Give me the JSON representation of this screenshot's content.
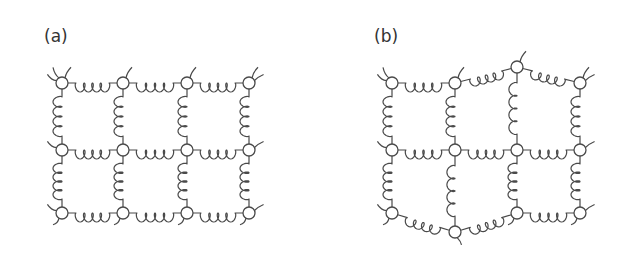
{
  "panels": [
    {
      "id": "a",
      "label": "(a)",
      "label_pos": [
        44,
        28
      ],
      "description": "regular lattice",
      "nodes": [
        [
          62,
          83
        ],
        [
          123,
          83
        ],
        [
          187,
          83
        ],
        [
          249,
          83
        ],
        [
          62,
          150
        ],
        [
          123,
          150
        ],
        [
          187,
          150
        ],
        [
          249,
          150
        ],
        [
          62,
          213
        ],
        [
          123,
          213
        ],
        [
          187,
          213
        ],
        [
          249,
          213
        ]
      ],
      "springs": [
        [
          0,
          1,
          "tight"
        ],
        [
          1,
          2,
          "tight"
        ],
        [
          2,
          3,
          "tight"
        ],
        [
          4,
          5,
          "tight"
        ],
        [
          5,
          6,
          "tight"
        ],
        [
          6,
          7,
          "tight"
        ],
        [
          8,
          9,
          "tight"
        ],
        [
          9,
          10,
          "tight"
        ],
        [
          10,
          11,
          "tight"
        ],
        [
          0,
          4,
          "tight"
        ],
        [
          1,
          5,
          "tight"
        ],
        [
          2,
          6,
          "tight"
        ],
        [
          3,
          7,
          "tight"
        ],
        [
          4,
          8,
          "tight"
        ],
        [
          5,
          9,
          "tight"
        ],
        [
          6,
          10,
          "tight"
        ],
        [
          7,
          11,
          "tight"
        ]
      ],
      "tails": [
        [
          0,
          "nw"
        ],
        [
          0,
          "ne"
        ],
        [
          0,
          "w"
        ],
        [
          1,
          "ne"
        ],
        [
          2,
          "ne"
        ],
        [
          3,
          "ne"
        ],
        [
          3,
          "e"
        ],
        [
          4,
          "w"
        ],
        [
          7,
          "e"
        ],
        [
          8,
          "w"
        ],
        [
          8,
          "sw"
        ],
        [
          9,
          "sw"
        ],
        [
          10,
          "sw"
        ],
        [
          11,
          "sw"
        ],
        [
          11,
          "e"
        ]
      ]
    },
    {
      "id": "b",
      "label": "(b)",
      "label_pos": [
        374,
        28
      ],
      "description": "deformed lattice",
      "nodes": [
        [
          392,
          83
        ],
        [
          455,
          83
        ],
        [
          517,
          67
        ],
        [
          580,
          83
        ],
        [
          392,
          150
        ],
        [
          455,
          150
        ],
        [
          517,
          150
        ],
        [
          580,
          150
        ],
        [
          392,
          213
        ],
        [
          455,
          232
        ],
        [
          517,
          213
        ],
        [
          580,
          213
        ]
      ],
      "springs": [
        [
          0,
          1,
          "tight"
        ],
        [
          1,
          2,
          "loose"
        ],
        [
          2,
          3,
          "loose"
        ],
        [
          4,
          5,
          "tight"
        ],
        [
          5,
          6,
          "tight"
        ],
        [
          6,
          7,
          "tight"
        ],
        [
          8,
          9,
          "loose"
        ],
        [
          9,
          10,
          "loose"
        ],
        [
          10,
          11,
          "tight"
        ],
        [
          0,
          4,
          "tight"
        ],
        [
          1,
          5,
          "tight"
        ],
        [
          2,
          6,
          "loose"
        ],
        [
          3,
          7,
          "tight"
        ],
        [
          4,
          8,
          "tight"
        ],
        [
          5,
          9,
          "loose"
        ],
        [
          6,
          10,
          "tight"
        ],
        [
          7,
          11,
          "tight"
        ]
      ],
      "tails": [
        [
          0,
          "nw"
        ],
        [
          0,
          "w"
        ],
        [
          1,
          "ne"
        ],
        [
          2,
          "ne"
        ],
        [
          3,
          "ne"
        ],
        [
          3,
          "e"
        ],
        [
          4,
          "w"
        ],
        [
          7,
          "e"
        ],
        [
          8,
          "w"
        ],
        [
          8,
          "sw"
        ],
        [
          9,
          "s"
        ],
        [
          10,
          "sw"
        ],
        [
          11,
          "sw"
        ],
        [
          11,
          "e"
        ]
      ]
    }
  ],
  "style": {
    "stroke": "#4a4a4a",
    "node_radius": 6,
    "background": "#ffffff"
  }
}
